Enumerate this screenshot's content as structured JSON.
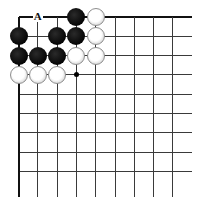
{
  "diagram": {
    "type": "go-board-fragment",
    "grid": {
      "columns": 9,
      "rows": 9,
      "origin_x": 18.5,
      "origin_y": 17,
      "spacing": 19.3,
      "line_end_x": 192,
      "line_end_y": 197,
      "top_edge": true,
      "left_edge": true,
      "line_color": "#3a3a3a",
      "edge_color": "#111111"
    },
    "labels": [
      {
        "text": "A",
        "col": 1,
        "row": 0
      }
    ],
    "star_points": [
      {
        "col": 3,
        "row": 3
      }
    ],
    "stones": [
      {
        "color": "black",
        "col": 3,
        "row": 0
      },
      {
        "color": "white",
        "col": 4,
        "row": 0
      },
      {
        "color": "black",
        "col": 0,
        "row": 1
      },
      {
        "color": "black",
        "col": 2,
        "row": 1
      },
      {
        "color": "black",
        "col": 3,
        "row": 1
      },
      {
        "color": "white",
        "col": 4,
        "row": 1
      },
      {
        "color": "black",
        "col": 0,
        "row": 2
      },
      {
        "color": "black",
        "col": 1,
        "row": 2
      },
      {
        "color": "black",
        "col": 2,
        "row": 2
      },
      {
        "color": "white",
        "col": 3,
        "row": 2
      },
      {
        "color": "white",
        "col": 4,
        "row": 2
      },
      {
        "color": "white",
        "col": 0,
        "row": 3
      },
      {
        "color": "white",
        "col": 1,
        "row": 3
      },
      {
        "color": "white",
        "col": 2,
        "row": 3
      }
    ]
  }
}
